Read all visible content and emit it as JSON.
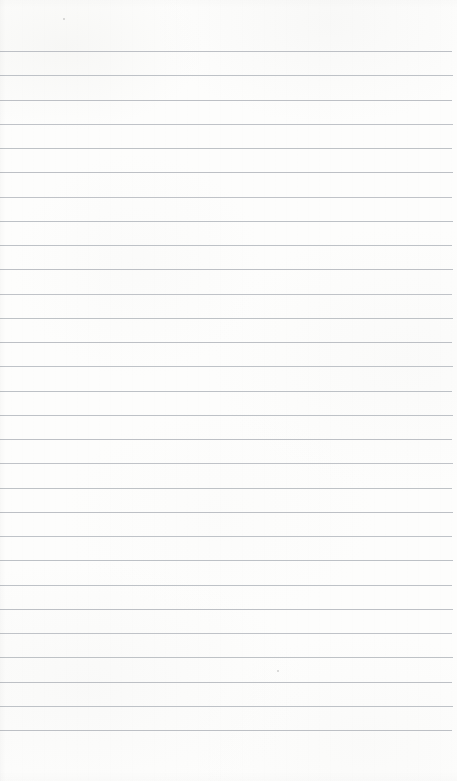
{
  "document": {
    "type": "scanned-lined-paper",
    "title": "Blank ruled notepad page",
    "page_width": 457,
    "page_height": 781,
    "background_color": "#fdfdfc",
    "has_text": false,
    "text_content": "",
    "handwriting_present": false
  },
  "paper": {
    "rule_color": "#b9bdc2",
    "rule_thickness": 1,
    "rule_count": 29,
    "first_rule_y": 51,
    "rule_spacing": 24.25,
    "rule_left_x": 0,
    "rule_right_x": 452,
    "top_margin": 51,
    "bottom_margin": 52,
    "left_margin": 0,
    "right_margin": 5,
    "margin_rule_present": false,
    "rules": [
      {
        "y": 51,
        "left": 0,
        "right": 452,
        "opacity": 0.95
      },
      {
        "y": 75,
        "left": 0,
        "right": 453,
        "opacity": 0.92
      },
      {
        "y": 100,
        "left": 0,
        "right": 452,
        "opacity": 0.95
      },
      {
        "y": 124,
        "left": 0,
        "right": 453,
        "opacity": 0.9
      },
      {
        "y": 148,
        "left": 0,
        "right": 452,
        "opacity": 0.93
      },
      {
        "y": 172,
        "left": 0,
        "right": 453,
        "opacity": 0.95
      },
      {
        "y": 197,
        "left": 0,
        "right": 452,
        "opacity": 0.9
      },
      {
        "y": 221,
        "left": 0,
        "right": 453,
        "opacity": 0.94
      },
      {
        "y": 245,
        "left": 0,
        "right": 452,
        "opacity": 0.92
      },
      {
        "y": 269,
        "left": 0,
        "right": 453,
        "opacity": 0.95
      },
      {
        "y": 294,
        "left": 0,
        "right": 452,
        "opacity": 0.9
      },
      {
        "y": 318,
        "left": 0,
        "right": 453,
        "opacity": 0.93
      },
      {
        "y": 342,
        "left": 0,
        "right": 452,
        "opacity": 0.95
      },
      {
        "y": 366,
        "left": 0,
        "right": 453,
        "opacity": 0.91
      },
      {
        "y": 391,
        "left": 0,
        "right": 452,
        "opacity": 0.94
      },
      {
        "y": 415,
        "left": 0,
        "right": 453,
        "opacity": 0.92
      },
      {
        "y": 439,
        "left": 0,
        "right": 452,
        "opacity": 0.95
      },
      {
        "y": 463,
        "left": 0,
        "right": 453,
        "opacity": 0.9
      },
      {
        "y": 488,
        "left": 0,
        "right": 452,
        "opacity": 0.93
      },
      {
        "y": 512,
        "left": 0,
        "right": 453,
        "opacity": 0.95
      },
      {
        "y": 536,
        "left": 0,
        "right": 452,
        "opacity": 0.91
      },
      {
        "y": 560,
        "left": 0,
        "right": 453,
        "opacity": 0.94
      },
      {
        "y": 585,
        "left": 0,
        "right": 452,
        "opacity": 0.92
      },
      {
        "y": 609,
        "left": 0,
        "right": 453,
        "opacity": 0.95
      },
      {
        "y": 633,
        "left": 0,
        "right": 452,
        "opacity": 0.9
      },
      {
        "y": 657,
        "left": 0,
        "right": 453,
        "opacity": 0.93
      },
      {
        "y": 682,
        "left": 0,
        "right": 452,
        "opacity": 0.95
      },
      {
        "y": 706,
        "left": 0,
        "right": 453,
        "opacity": 0.92
      },
      {
        "y": 730,
        "left": 0,
        "right": 452,
        "opacity": 0.95
      }
    ],
    "artifacts": [
      {
        "name": "scanner-speck",
        "x": 277,
        "y": 670
      },
      {
        "name": "scanner-speck",
        "x": 63,
        "y": 18
      }
    ]
  }
}
